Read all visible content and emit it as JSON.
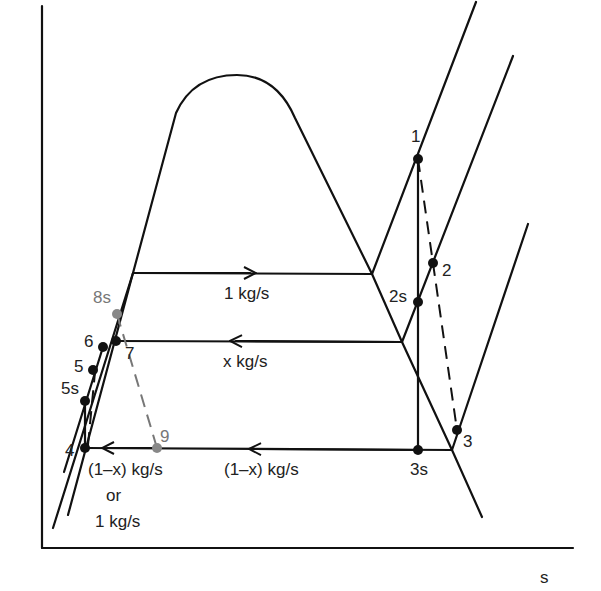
{
  "diagram": {
    "type": "T-s diagram (regenerative Rankine cycle)",
    "axes": {
      "x_label": "s",
      "y_label": ""
    },
    "flow_labels": {
      "top": "1 kg/s",
      "middle": "x kg/s",
      "bottom": "(1–x) kg/s",
      "pump_line1": "(1–x) kg/s",
      "pump_line2": "or",
      "pump_line3": "1 kg/s"
    },
    "states": [
      {
        "id": "1",
        "label": "1",
        "x": 418,
        "y": 159,
        "color": "#111111"
      },
      {
        "id": "2",
        "label": "2",
        "x": 433,
        "y": 263,
        "color": "#111111"
      },
      {
        "id": "2s",
        "label": "2s",
        "x": 418,
        "y": 302,
        "color": "#111111"
      },
      {
        "id": "3",
        "label": "3",
        "x": 457,
        "y": 430,
        "color": "#111111"
      },
      {
        "id": "3s",
        "label": "3s",
        "x": 418,
        "y": 450,
        "color": "#111111"
      },
      {
        "id": "4",
        "label": "4",
        "x": 85,
        "y": 448,
        "color": "#111111"
      },
      {
        "id": "5s",
        "label": "5s",
        "x": 85,
        "y": 401,
        "color": "#111111"
      },
      {
        "id": "5",
        "label": "5",
        "x": 93,
        "y": 370,
        "color": "#111111"
      },
      {
        "id": "6",
        "label": "6",
        "x": 103,
        "y": 347,
        "color": "#111111"
      },
      {
        "id": "7",
        "label": "7",
        "x": 116,
        "y": 341,
        "color": "#111111"
      },
      {
        "id": "8s",
        "label": "8s",
        "x": 117,
        "y": 314,
        "color": "#888888"
      },
      {
        "id": "9",
        "label": "9",
        "x": 157,
        "y": 448,
        "color": "#888888"
      }
    ]
  }
}
